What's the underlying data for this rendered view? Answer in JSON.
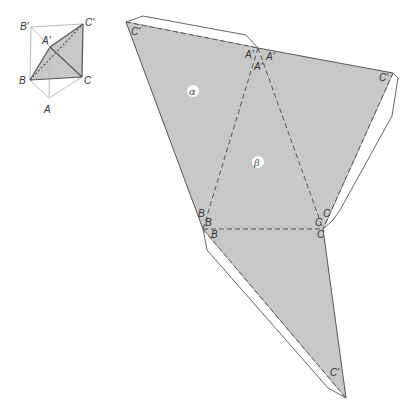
{
  "colors": {
    "face_fill": "#c8c8c8",
    "edge": "#555555",
    "fold": "#555555",
    "tab_fill": "#ffffff",
    "label": "#333333",
    "box_edge": "#bbbbbb"
  },
  "small_figure": {
    "labels": {
      "B_prime": "B'",
      "C_prime": "C'",
      "A_prime": "A'",
      "B": "B",
      "C": "C",
      "A": "A"
    }
  },
  "net": {
    "face_labels": {
      "alpha": "α",
      "beta": "β"
    },
    "vertex_labels": {
      "c_prime_top_left": "C'",
      "a_prime_left": "A'",
      "a_prime_right": "A'",
      "a_prime_middle": "A'",
      "c_prime_right": "C'",
      "b_upper": "B",
      "b_middle": "B",
      "b_lower": "B",
      "c_upper": "C",
      "c_middle": "C",
      "c_lower": "C",
      "c_prime_bottom": "C'"
    }
  }
}
